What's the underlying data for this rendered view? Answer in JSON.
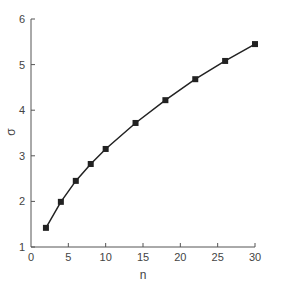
{
  "chart_data": {
    "type": "line",
    "title": "",
    "xlabel": "n",
    "ylabel": "σ",
    "xlim": [
      0,
      30
    ],
    "ylim": [
      1,
      6
    ],
    "xticks": [
      0,
      5,
      10,
      15,
      20,
      25,
      30
    ],
    "yticks": [
      1,
      2,
      3,
      4,
      5,
      6
    ],
    "grid": false,
    "legend": null,
    "marker": "square",
    "series": [
      {
        "name": "σ",
        "x": [
          2,
          4,
          6,
          8,
          10,
          14,
          18,
          22,
          26,
          30
        ],
        "values": [
          1.42,
          1.99,
          2.45,
          2.82,
          3.15,
          3.72,
          4.22,
          4.68,
          5.08,
          5.45
        ]
      }
    ],
    "colors": {
      "line": "#222222",
      "axis": "#555555"
    }
  }
}
